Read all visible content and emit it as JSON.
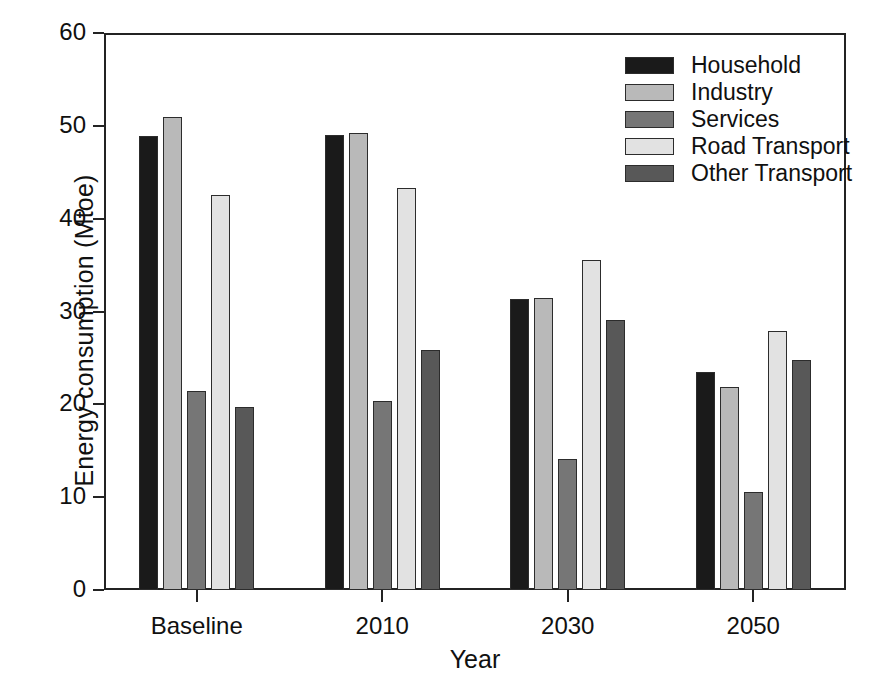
{
  "chart_data": {
    "type": "bar",
    "title": "",
    "xlabel": "Year",
    "ylabel": "Energy consumption (Mtoe)",
    "categories": [
      "Baseline",
      "2010",
      "2030",
      "2050"
    ],
    "ylim": [
      0,
      60
    ],
    "yticks": [
      0,
      10,
      20,
      30,
      40,
      50,
      60
    ],
    "ytick_labels": [
      "0",
      "10",
      "20",
      "30",
      "40",
      "50",
      "60"
    ],
    "grid": false,
    "legend_position": "top-right",
    "series": [
      {
        "name": "Household",
        "color": "#1a1a1a",
        "values": [
          48.9,
          49.0,
          31.3,
          23.5
        ]
      },
      {
        "name": "Industry",
        "color": "#b9b9b9",
        "values": [
          50.9,
          49.2,
          31.5,
          21.9
        ]
      },
      {
        "name": "Services",
        "color": "#767676",
        "values": [
          21.4,
          20.4,
          14.1,
          10.6
        ]
      },
      {
        "name": "Road Transport",
        "color": "#e2e2e2",
        "values": [
          42.5,
          43.3,
          35.6,
          27.9
        ]
      },
      {
        "name": "Other Transport",
        "color": "#585858",
        "values": [
          19.7,
          25.9,
          29.1,
          24.8
        ]
      }
    ]
  },
  "axis": {
    "frame_color": "#232323",
    "tick_color": "#232323",
    "text_color": "#101010"
  }
}
